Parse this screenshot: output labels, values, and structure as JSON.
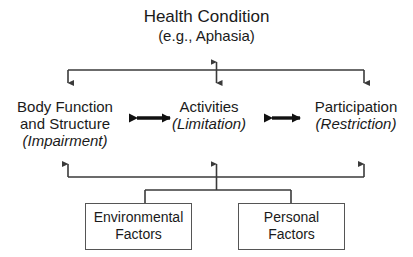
{
  "diagram": {
    "health_condition": {
      "title": "Health Condition",
      "subtitle": "(e.g., Aphasia)"
    },
    "concepts": [
      {
        "id": "body",
        "line1": "Body Function",
        "line2": "and Structure",
        "qualifier": "(Impairment)"
      },
      {
        "id": "activities",
        "line1": "Activities",
        "qualifier": "(Limitation)"
      },
      {
        "id": "participation",
        "line1": "Participation",
        "qualifier": "(Restriction)"
      }
    ],
    "contextual_factors": [
      {
        "id": "environmental",
        "line1": "Environmental",
        "line2": "Factors"
      },
      {
        "id": "personal",
        "line1": "Personal",
        "line2": "Factors"
      }
    ],
    "colors": {
      "line": "#3a3a3a",
      "box_border": "#555555",
      "text": "#1a1a1a",
      "background": "#ffffff"
    }
  }
}
